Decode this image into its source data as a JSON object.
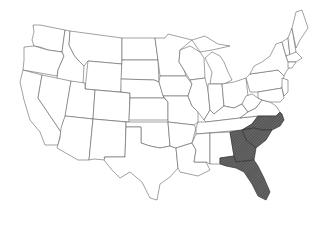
{
  "map": {
    "type": "choropleth",
    "region": "Contiguous United States",
    "style": "outline map with state borders",
    "highlight_color": "#5a5a5a",
    "outline_color": "#555555",
    "background": "#ffffff",
    "highlighted_states": [
      "North Carolina",
      "South Carolina",
      "Georgia",
      "Florida"
    ],
    "highlight_pattern": "dark diagonal hatch"
  }
}
